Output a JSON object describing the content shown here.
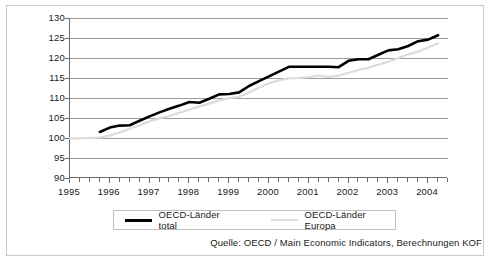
{
  "chart_data": {
    "type": "line",
    "title": "",
    "subtitle": "",
    "xlabel": "",
    "ylabel": "",
    "xlim": [
      1995.0,
      2004.5
    ],
    "ylim": [
      90,
      130
    ],
    "ytick_values": [
      90,
      95,
      100,
      105,
      110,
      115,
      120,
      125,
      130
    ],
    "ytick_labels": [
      "90",
      "95",
      "100",
      "105",
      "110",
      "115",
      "120",
      "125",
      "130"
    ],
    "xtick_labels": [
      "1995",
      "1996",
      "1997",
      "1998",
      "1999",
      "2000",
      "2001",
      "2002",
      "2003",
      "2004"
    ],
    "xtick_values": [
      1995,
      1996,
      1997,
      1998,
      1999,
      2000,
      2001,
      2002,
      2003,
      2004
    ],
    "minor_xticks_per_year": 4,
    "grid": "horizontal",
    "legend_position": "bottom",
    "index_base": "1995 = 100",
    "series": [
      {
        "name": "OECD-Länder total",
        "color": "#000000",
        "width": 2.6,
        "x": [
          1995.75,
          1996.0,
          1996.25,
          1996.5,
          1996.75,
          1997.0,
          1997.25,
          1997.5,
          1997.75,
          1998.0,
          1998.25,
          1998.5,
          1998.75,
          1999.0,
          1999.25,
          1999.5,
          1999.75,
          2000.0,
          2000.25,
          2000.5,
          2000.75,
          2001.0,
          2001.25,
          2001.5,
          2001.75,
          2002.0,
          2002.25,
          2002.5,
          2002.75,
          2003.0,
          2003.25,
          2003.5,
          2003.75,
          2004.0,
          2004.25
        ],
        "values": [
          101.5,
          102.6,
          103.1,
          103.2,
          104.3,
          105.4,
          106.4,
          107.3,
          108.1,
          109.0,
          108.8,
          109.8,
          110.9,
          111.0,
          111.4,
          113.0,
          114.2,
          115.4,
          116.6,
          117.8,
          117.8,
          117.8,
          117.8,
          117.8,
          117.7,
          119.3,
          119.7,
          119.7,
          120.8,
          121.9,
          122.2,
          123.0,
          124.2,
          124.6,
          125.7
        ]
      },
      {
        "name": "OECD-Länder Europa",
        "color": "#dcdcdc",
        "width": 2.2,
        "x": [
          1995.0,
          1995.25,
          1995.5,
          1995.75,
          1996.0,
          1996.25,
          1996.5,
          1996.75,
          1997.0,
          1997.25,
          1997.5,
          1997.75,
          1998.0,
          1998.25,
          1998.5,
          1998.75,
          1999.0,
          1999.25,
          1999.5,
          1999.75,
          2000.0,
          2000.25,
          2000.5,
          2000.75,
          2001.0,
          2001.25,
          2001.5,
          2001.75,
          2002.0,
          2002.25,
          2002.5,
          2002.75,
          2003.0,
          2003.25,
          2003.5,
          2003.75,
          2004.0,
          2004.25
        ],
        "values": [
          99.9,
          99.9,
          100.0,
          100.1,
          100.6,
          101.4,
          102.3,
          103.2,
          104.2,
          104.9,
          105.5,
          106.3,
          107.1,
          107.9,
          108.6,
          109.4,
          110.0,
          110.3,
          111.4,
          112.6,
          113.7,
          114.4,
          114.9,
          115.0,
          115.2,
          115.6,
          115.3,
          115.6,
          116.3,
          117.0,
          117.6,
          118.3,
          119.1,
          120.0,
          120.9,
          121.6,
          122.6,
          123.7
        ]
      }
    ]
  },
  "legend": {
    "entries": [
      {
        "label": "OECD-Länder total",
        "swatch": "thick-black-line"
      },
      {
        "label": "OECD-Länder Europa",
        "swatch": "thin-grey-line"
      }
    ]
  },
  "source": {
    "text": "Quelle: OECD / Main Economic Indicators, Berechnungen KOF"
  },
  "colors": {
    "series_total": "#000000",
    "series_europa": "#dcdcdc",
    "axis": "#6b6b6b",
    "gridline": "#9a9a9a",
    "frame": "#c9c9c9",
    "text": "#1a1a1a"
  }
}
